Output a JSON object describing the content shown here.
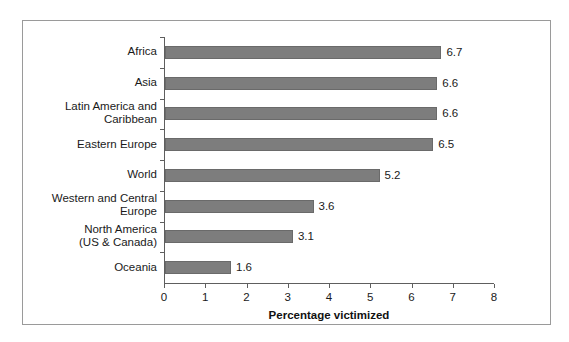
{
  "chart_data": {
    "type": "bar",
    "orientation": "horizontal",
    "title": "",
    "xlabel": "Percentage victimized",
    "ylabel": "",
    "xlim": [
      0,
      8
    ],
    "xticks": [
      "0",
      "1",
      "2",
      "3",
      "4",
      "5",
      "6",
      "7",
      "8"
    ],
    "grid": false,
    "legend": null,
    "categories": [
      "Africa",
      "Asia",
      "Latin America and\nCaribbean",
      "Eastern Europe",
      "World",
      "Western and Central\nEurope",
      "North America\n(US & Canada)",
      "Oceania"
    ],
    "values": [
      6.7,
      6.6,
      6.6,
      6.5,
      5.2,
      3.6,
      3.1,
      1.6
    ],
    "value_labels": [
      "6.7",
      "6.6",
      "6.6",
      "6.5",
      "5.2",
      "3.6",
      "3.1",
      "1.6"
    ],
    "colors": {
      "bar_fill": "#7d7d7d",
      "bar_stroke": "#6a6a6a",
      "axis": "#5e5e5e",
      "frame": "#9a9a9a",
      "text": "#1a1a1a",
      "background": "#ffffff"
    }
  }
}
